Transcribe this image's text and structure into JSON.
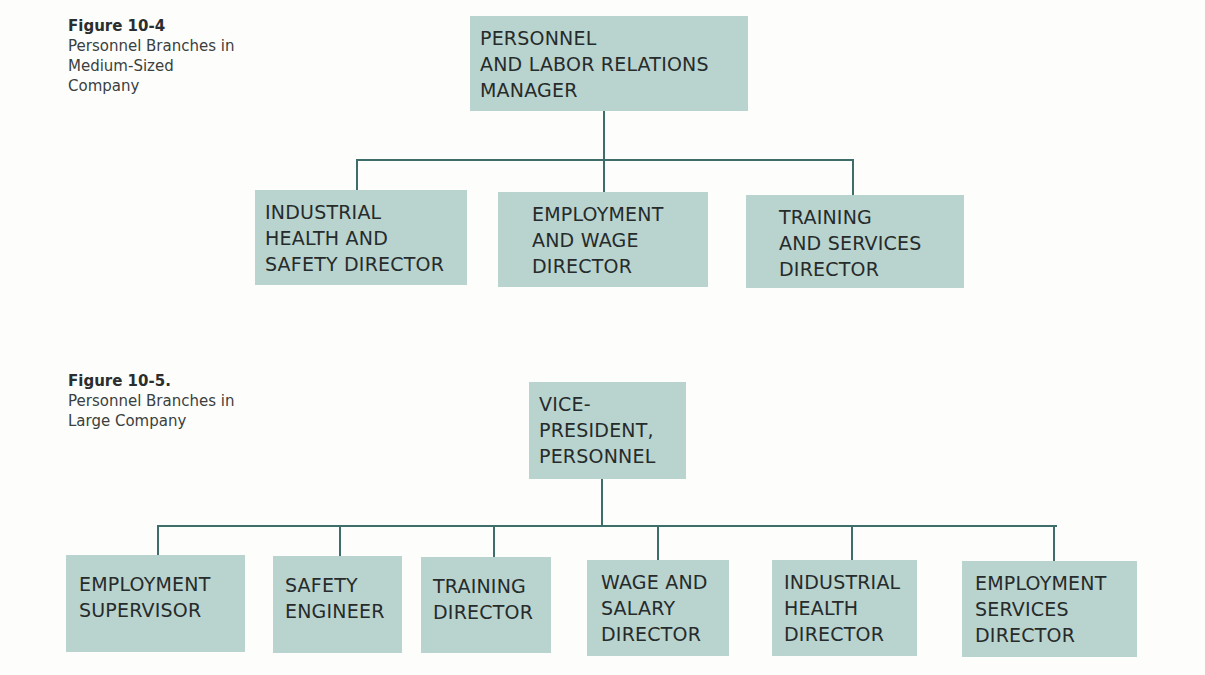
{
  "colors": {
    "box": "#b9d3cf",
    "line": "#3e6e6a",
    "text": "#262b2b"
  },
  "figures": [
    {
      "label": "Figure 10-4",
      "description": "Personnel Branches in\nMedium-Sized\nCompany",
      "root": "PERSONNEL\nAND LABOR RELATIONS\nMANAGER",
      "children": [
        "INDUSTRIAL\nHEALTH AND\nSAFETY DIRECTOR",
        "EMPLOYMENT\nAND WAGE\nDIRECTOR",
        "TRAINING\nAND SERVICES\nDIRECTOR"
      ]
    },
    {
      "label": "Figure 10-5.",
      "description": "Personnel Branches in\nLarge Company",
      "root": "VICE-\nPRESIDENT,\nPERSONNEL",
      "children": [
        "EMPLOYMENT\nSUPERVISOR",
        "SAFETY\nENGINEER",
        "TRAINING\nDIRECTOR",
        "WAGE AND\nSALARY\nDIRECTOR",
        "INDUSTRIAL\nHEALTH\nDIRECTOR",
        "EMPLOYMENT\nSERVICES\nDIRECTOR"
      ]
    }
  ]
}
